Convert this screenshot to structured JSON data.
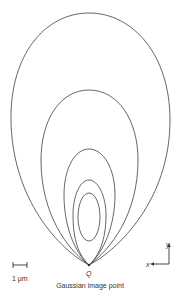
{
  "figure": {
    "point_label": "Q",
    "caption": "Gaussian image point",
    "scale_bar_label": "1 μm",
    "axis_x_label": "x",
    "axis_y_label": "y",
    "curve_count": 5,
    "stroke_color": "#555555"
  }
}
